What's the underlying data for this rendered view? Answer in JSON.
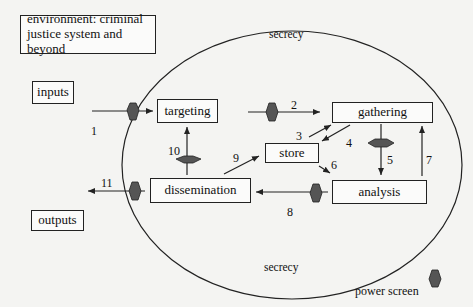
{
  "environment_label": "environment: criminal justice system and beyond",
  "environment_lines": [
    "environment: criminal",
    "justice system and beyond"
  ],
  "boundary_label_top": "secrecy",
  "boundary_label_bottom": "secrecy",
  "nodes": {
    "inputs": "inputs",
    "outputs": "outputs",
    "targeting": "targeting",
    "gathering": "gathering",
    "store": "store",
    "dissemination": "dissemination",
    "analysis": "analysis"
  },
  "edges": [
    {
      "num": "1",
      "from": "inputs",
      "to": "targeting",
      "power_screen": true
    },
    {
      "num": "2",
      "from": "targeting",
      "to": "gathering",
      "power_screen": true
    },
    {
      "num": "3",
      "from": "store",
      "to": "gathering",
      "power_screen": false
    },
    {
      "num": "4",
      "from": "gathering",
      "to": "store",
      "power_screen": false
    },
    {
      "num": "5",
      "from": "gathering",
      "to": "analysis",
      "power_screen": true
    },
    {
      "num": "6",
      "from": "store",
      "to": "analysis",
      "power_screen": false
    },
    {
      "num": "7",
      "from": "analysis",
      "to": "gathering",
      "power_screen": false
    },
    {
      "num": "8",
      "from": "analysis",
      "to": "dissemination",
      "power_screen": true
    },
    {
      "num": "9",
      "from": "dissemination",
      "to": "store",
      "power_screen": false
    },
    {
      "num": "10",
      "from": "dissemination",
      "to": "targeting",
      "power_screen": true
    },
    {
      "num": "11",
      "from": "dissemination",
      "to": "outputs",
      "power_screen": true
    }
  ],
  "legend": {
    "label": "power screen",
    "icon": "hexagon-icon"
  },
  "colors": {
    "power_screen": "#555555",
    "line": "#222222",
    "background": "#f4f4f2"
  }
}
